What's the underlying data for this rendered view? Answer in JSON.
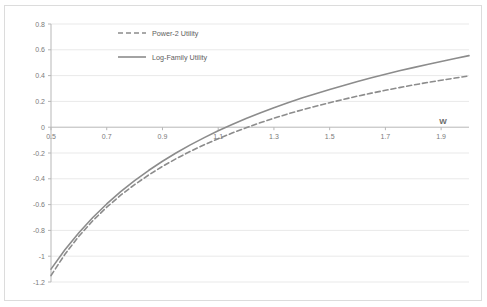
{
  "chart_data": {
    "type": "line",
    "title": "",
    "xlabel": "W",
    "ylabel": "",
    "xlim": [
      0.5,
      2.0
    ],
    "ylim": [
      -1.2,
      0.8
    ],
    "grid": true,
    "legend_position": "top-center",
    "xticks": [
      "0.5",
      "0.7",
      "0.9",
      "1.1",
      "1.3",
      "1.5",
      "1.7",
      "1.9"
    ],
    "xtick_values": [
      0.5,
      0.7,
      0.9,
      1.1,
      1.3,
      1.5,
      1.7,
      1.9
    ],
    "yticks": [
      "0.8",
      "0.6",
      "0.4",
      "0.2",
      "0",
      "-0.2",
      "-0.4",
      "-0.6",
      "-0.8",
      "-1",
      "-1.2"
    ],
    "ytick_values": [
      0.8,
      0.6,
      0.4,
      0.2,
      0,
      -0.2,
      -0.4,
      -0.6,
      -0.8,
      -1,
      -1.2
    ],
    "x": [
      0.5,
      0.55,
      0.6,
      0.65,
      0.7,
      0.75,
      0.8,
      0.85,
      0.9,
      0.95,
      1.0,
      1.05,
      1.1,
      1.15,
      1.2,
      1.25,
      1.3,
      1.35,
      1.4,
      1.45,
      1.5,
      1.55,
      1.6,
      1.65,
      1.7,
      1.75,
      1.8,
      1.85,
      1.9,
      1.95,
      2.0
    ],
    "series": [
      {
        "name": "Power-2 Utility",
        "style": "dashed",
        "color": "#8c8c8c",
        "values": [
          -1.15,
          -0.985,
          -0.845,
          -0.725,
          -0.62,
          -0.527,
          -0.445,
          -0.371,
          -0.304,
          -0.243,
          -0.187,
          -0.136,
          -0.089,
          -0.045,
          -0.004,
          0.034,
          0.07,
          0.103,
          0.134,
          0.163,
          0.19,
          0.216,
          0.241,
          0.264,
          0.286,
          0.307,
          0.327,
          0.346,
          0.364,
          0.381,
          0.398
        ]
      },
      {
        "name": "Log-Family Utility",
        "style": "solid",
        "color": "#8c8c8c",
        "values": [
          -1.1,
          -0.95,
          -0.818,
          -0.7,
          -0.595,
          -0.5,
          -0.414,
          -0.336,
          -0.264,
          -0.198,
          -0.137,
          -0.081,
          -0.028,
          0.021,
          0.067,
          0.11,
          0.151,
          0.189,
          0.226,
          0.26,
          0.293,
          0.324,
          0.354,
          0.383,
          0.41,
          0.437,
          0.462,
          0.486,
          0.51,
          0.533,
          0.555
        ]
      }
    ]
  },
  "legend": {
    "items": [
      {
        "label": "Power-2 Utility",
        "style": "dashed"
      },
      {
        "label": "Log-Family Utility",
        "style": "solid"
      }
    ]
  },
  "axis": {
    "x_title": "W"
  },
  "colors": {
    "series_gray": "#8c8c8c",
    "axis_line": "#b7b7b7",
    "gridline": "#e9e9e9",
    "tick_text": "#7a7a7a",
    "frame_border": "#dcdcdc",
    "background": "#ffffff"
  }
}
